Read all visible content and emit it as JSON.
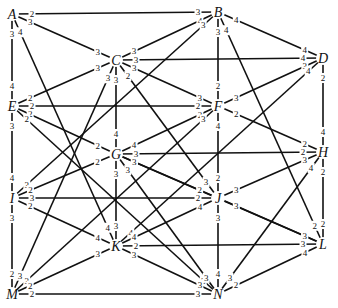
{
  "diagram": {
    "type": "weighted-graph",
    "nodes": [
      {
        "id": "A",
        "x": 12,
        "y": 14
      },
      {
        "id": "B",
        "x": 218,
        "y": 12
      },
      {
        "id": "C",
        "x": 116,
        "y": 60
      },
      {
        "id": "D",
        "x": 323,
        "y": 58
      },
      {
        "id": "E",
        "x": 12,
        "y": 106
      },
      {
        "id": "F",
        "x": 218,
        "y": 106
      },
      {
        "id": "G",
        "x": 116,
        "y": 154
      },
      {
        "id": "H",
        "x": 323,
        "y": 152
      },
      {
        "id": "I",
        "x": 12,
        "y": 198
      },
      {
        "id": "J",
        "x": 218,
        "y": 198
      },
      {
        "id": "K",
        "x": 116,
        "y": 246
      },
      {
        "id": "L",
        "x": 323,
        "y": 244
      },
      {
        "id": "M",
        "x": 12,
        "y": 294
      },
      {
        "id": "N",
        "x": 218,
        "y": 294
      }
    ],
    "edges": [
      {
        "from": "A",
        "to": "B",
        "w1": "2",
        "w2": "3"
      },
      {
        "from": "A",
        "to": "C",
        "w1": "3",
        "w2": "3"
      },
      {
        "from": "A",
        "to": "E",
        "w1": "3",
        "w2": "4"
      },
      {
        "from": "A",
        "to": "K",
        "w1": "4",
        "w2": "4"
      },
      {
        "from": "B",
        "to": "C",
        "w1": "4",
        "w2": "3"
      },
      {
        "from": "B",
        "to": "D",
        "w1": "4",
        "w2": "4"
      },
      {
        "from": "B",
        "to": "F",
        "w1": "3",
        "w2": "2"
      },
      {
        "from": "B",
        "to": "L",
        "w1": "4",
        "w2": "2"
      },
      {
        "from": "B",
        "to": "I",
        "w1": "3",
        "w2": "3"
      },
      {
        "from": "C",
        "to": "D",
        "w1": "3",
        "w2": "4"
      },
      {
        "from": "C",
        "to": "E",
        "w1": "3",
        "w2": "2"
      },
      {
        "from": "C",
        "to": "F",
        "w1": "3",
        "w2": "3"
      },
      {
        "from": "C",
        "to": "G",
        "w1": "3",
        "w2": "4"
      },
      {
        "from": "C",
        "to": "J",
        "w1": "2",
        "w2": "3"
      },
      {
        "from": "C",
        "to": "M",
        "w1": "3",
        "w2": "3"
      },
      {
        "from": "D",
        "to": "F",
        "w1": "3",
        "w2": "3"
      },
      {
        "from": "D",
        "to": "H",
        "w1": "2",
        "w2": "4"
      },
      {
        "from": "D",
        "to": "K",
        "w1": "4",
        "w2": "4"
      },
      {
        "from": "E",
        "to": "F",
        "w1": "2",
        "w2": "2"
      },
      {
        "from": "E",
        "to": "G",
        "w1": "2",
        "w2": "2"
      },
      {
        "from": "E",
        "to": "I",
        "w1": "3",
        "w2": "4"
      },
      {
        "from": "E",
        "to": "N",
        "w1": "2",
        "w2": "3"
      },
      {
        "from": "F",
        "to": "G",
        "w1": "2",
        "w2": "4"
      },
      {
        "from": "F",
        "to": "H",
        "w1": "2",
        "w2": "2"
      },
      {
        "from": "F",
        "to": "J",
        "w1": "4",
        "w2": "2"
      },
      {
        "from": "F",
        "to": "M",
        "w1": "3",
        "w2": "3"
      },
      {
        "from": "G",
        "to": "H",
        "w1": "3",
        "w2": "2"
      },
      {
        "from": "G",
        "to": "I",
        "w1": "2",
        "w2": "2"
      },
      {
        "from": "G",
        "to": "J",
        "w1": "3",
        "w2": "2"
      },
      {
        "from": "G",
        "to": "K",
        "w1": "3",
        "w2": "3"
      },
      {
        "from": "G",
        "to": "N",
        "w1": "3",
        "w2": "3"
      },
      {
        "from": "G",
        "to": "L",
        "w1": "3",
        "w2": "3"
      },
      {
        "from": "H",
        "to": "J",
        "w1": "3",
        "w2": "3"
      },
      {
        "from": "H",
        "to": "L",
        "w1": "2",
        "w2": "2"
      },
      {
        "from": "H",
        "to": "N",
        "w1": "4",
        "w2": "3"
      },
      {
        "from": "I",
        "to": "J",
        "w1": "3",
        "w2": "2"
      },
      {
        "from": "I",
        "to": "K",
        "w1": "2",
        "w2": "4"
      },
      {
        "from": "I",
        "to": "M",
        "w1": "3",
        "w2": "2"
      },
      {
        "from": "J",
        "to": "K",
        "w1": "4",
        "w2": "4"
      },
      {
        "from": "J",
        "to": "L",
        "w1": "3",
        "w2": "3"
      },
      {
        "from": "J",
        "to": "N",
        "w1": "3",
        "w2": "4"
      },
      {
        "from": "K",
        "to": "L",
        "w1": "2",
        "w2": "3"
      },
      {
        "from": "K",
        "to": "M",
        "w1": "3",
        "w2": "2"
      },
      {
        "from": "K",
        "to": "N",
        "w1": "3",
        "w2": "3"
      },
      {
        "from": "L",
        "to": "N",
        "w1": "4",
        "w2": "2"
      },
      {
        "from": "M",
        "to": "N",
        "w1": "2",
        "w2": "3"
      }
    ]
  }
}
